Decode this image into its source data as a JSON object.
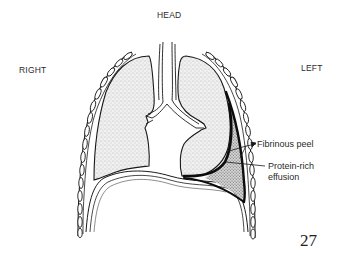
{
  "diagram": {
    "type": "anatomical-illustration",
    "orientation": {
      "top": "HEAD",
      "left": "RIGHT",
      "right": "LEFT"
    },
    "annotations": [
      {
        "id": "fibrinous-peel",
        "text": "Fibrinous peel"
      },
      {
        "id": "protein-rich-effusion",
        "line1": "Protein-rich",
        "line2": "effusion"
      }
    ],
    "page_number": "27",
    "colors": {
      "ink": "#1a1a1a",
      "lung_fill": "#e6e6e6",
      "effusion_fill": "#bdbdbd",
      "background": "#ffffff"
    }
  }
}
